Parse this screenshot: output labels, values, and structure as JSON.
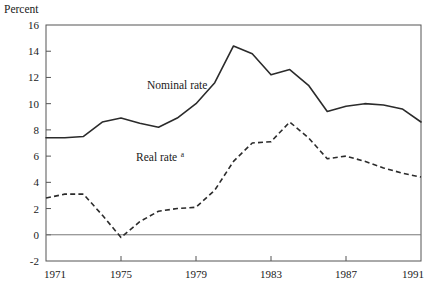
{
  "chart_data": {
    "type": "line",
    "title": "",
    "ylabel": "Percent",
    "xlabel": "",
    "xlim": [
      1971,
      1991
    ],
    "ylim": [
      -2,
      16
    ],
    "ytick_step": 2,
    "yticks": [
      -2,
      0,
      2,
      4,
      6,
      8,
      10,
      12,
      14,
      16
    ],
    "ytick_labels": [
      "-2",
      "0",
      "2",
      "4",
      "6",
      "8",
      "10",
      "12",
      "14",
      "16"
    ],
    "xticks": [
      1971,
      1975,
      1979,
      1983,
      1987,
      1991
    ],
    "xtick_labels": [
      "1971",
      "1975",
      "1979",
      "1983",
      "1987",
      "1991"
    ],
    "grid": false,
    "zero_line": true,
    "legend_position": "inline-annotations",
    "x": [
      1971,
      1972,
      1973,
      1974,
      1975,
      1976,
      1977,
      1978,
      1979,
      1980,
      1981,
      1982,
      1983,
      1984,
      1985,
      1986,
      1987,
      1988,
      1989,
      1990,
      1991
    ],
    "series": [
      {
        "name": "Nominal rate",
        "style": "solid",
        "label": "Nominal rate",
        "label_x": 1978.0,
        "label_y": 11.1,
        "values": [
          7.4,
          7.4,
          7.5,
          8.6,
          8.9,
          8.5,
          8.2,
          8.9,
          10.0,
          11.6,
          14.4,
          13.8,
          12.2,
          12.6,
          11.4,
          9.4,
          9.8,
          10.0,
          9.9,
          9.6,
          8.6
        ]
      },
      {
        "name": "Real rate",
        "style": "dashed",
        "label": "Real rate",
        "label_superscript": "a",
        "label_x": 1976.9,
        "label_y": 5.6,
        "values": [
          2.8,
          3.1,
          3.1,
          1.5,
          -0.2,
          1.0,
          1.8,
          2.0,
          2.1,
          3.4,
          5.6,
          7.0,
          7.1,
          8.6,
          7.4,
          5.8,
          6.0,
          5.6,
          5.1,
          4.7,
          4.4
        ]
      }
    ],
    "annotations": [
      {
        "text": "Percent",
        "role": "y-axis-title"
      },
      {
        "text": "a",
        "role": "footnote-marker"
      }
    ]
  },
  "layout": {
    "plot_left": 46,
    "plot_right": 421,
    "plot_top": 25,
    "plot_bottom": 261
  }
}
